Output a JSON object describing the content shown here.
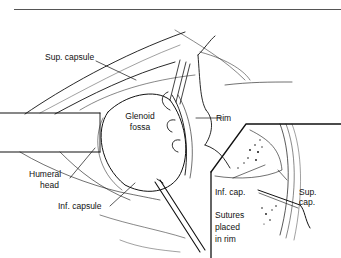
{
  "figure": {
    "labels": {
      "sup_capsule": "Sup. capsule",
      "glenoid_line1": "Glenoid",
      "glenoid_line2": "fossa",
      "rim": "Rim",
      "humeral_line1": "Humeral",
      "humeral_line2": "head",
      "inf_capsule": "Inf. capsule",
      "inf_cap": "Inf. cap.",
      "sup_cap_line1": "Sup.",
      "sup_cap_line2": "cap.",
      "sutures_line1": "Sutures",
      "sutures_line2": "placed",
      "sutures_line3": "in rim"
    },
    "colors": {
      "line": "#111111",
      "background": "#ffffff",
      "rule": "#555555"
    }
  }
}
